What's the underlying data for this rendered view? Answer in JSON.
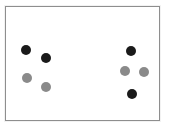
{
  "figure": {
    "background_color": "#ffffff",
    "frame": {
      "border_color": "#8e8e8e",
      "fill_color": "#ffffff",
      "x": 5,
      "y": 6,
      "width": 155,
      "height": 115
    },
    "caption": "",
    "caption_color": "#d8d8d8"
  },
  "chart_data": {
    "type": "scatter",
    "title": "",
    "xlabel": "",
    "ylabel": "",
    "xlim": [
      0,
      155
    ],
    "ylim": [
      0,
      115
    ],
    "grid": false,
    "legend": "none",
    "marker_diameter": 10,
    "colors": {
      "dark": "#1a1a1a",
      "grey": "#8a8a8a"
    },
    "series": [
      {
        "name": "dark",
        "color": "#1a1a1a",
        "points": [
          {
            "x": 20,
            "y": 43,
            "label": "left-cluster-dark-1"
          },
          {
            "x": 40,
            "y": 51,
            "label": "left-cluster-dark-2"
          },
          {
            "x": 125,
            "y": 44,
            "label": "right-cluster-dark-top"
          },
          {
            "x": 126,
            "y": 87,
            "label": "right-cluster-dark-bottom"
          }
        ]
      },
      {
        "name": "grey",
        "color": "#8a8a8a",
        "points": [
          {
            "x": 21,
            "y": 71,
            "label": "left-cluster-grey-1"
          },
          {
            "x": 40,
            "y": 80,
            "label": "left-cluster-grey-2"
          },
          {
            "x": 119,
            "y": 64,
            "label": "right-cluster-grey-left"
          },
          {
            "x": 138,
            "y": 65,
            "label": "right-cluster-grey-right"
          }
        ]
      }
    ],
    "clusters": [
      {
        "name": "left-cluster",
        "count": 4,
        "dark": 2,
        "grey": 2
      },
      {
        "name": "right-cluster",
        "count": 4,
        "dark": 2,
        "grey": 2
      }
    ]
  }
}
